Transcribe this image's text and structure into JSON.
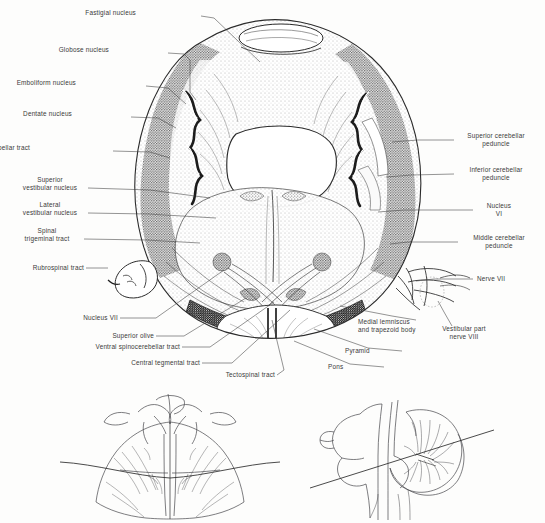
{
  "figure": {
    "kind": "anatomical-illustration",
    "background_color": "#fdfdfc",
    "ink_color": "#2b2b2b",
    "label_color": "#3a3a3a"
  },
  "labels_left": [
    {
      "id": "fastigial-nucleus",
      "text": "Fastigial nucleus",
      "x": 136,
      "y": 13,
      "lead_to_x": 258,
      "lead_to_y": 60
    },
    {
      "id": "globose-nucleus",
      "text": "Globose nucleus",
      "x": 109,
      "y": 50,
      "lead_to_x": 205,
      "lead_to_y": 92
    },
    {
      "id": "emboliform-nucleus",
      "text": "Emboliform nucleus",
      "x": 76,
      "y": 83,
      "lead_to_x": 196,
      "lead_to_y": 106
    },
    {
      "id": "dentate-nucleus",
      "text": "Dentate nucleus",
      "x": 72,
      "y": 114,
      "lead_to_x": 180,
      "lead_to_y": 126
    },
    {
      "id": "nucleocerebellar-tract",
      "text": "Nucleocerebellar tract",
      "x": 30,
      "y": 148,
      "lead_to_x": 168,
      "lead_to_y": 155
    },
    {
      "id": "superior-vestibular-nucleus",
      "text": "Superior\nvestibular nucleus",
      "x": 27,
      "y": 180,
      "lead_to_x": 210,
      "lead_to_y": 196
    },
    {
      "id": "lateral-vestibular-nucleus",
      "text": "Lateral\nvestibular nucleus",
      "x": 13,
      "y": 205,
      "lead_to_x": 215,
      "lead_to_y": 217
    },
    {
      "id": "spinal-trigeminal-tract",
      "text": "Spinal\ntrigeminal tract",
      "x": 30,
      "y": 231,
      "lead_to_x": 200,
      "lead_to_y": 242
    },
    {
      "id": "rubrospinal-tract",
      "text": "Rubrospinal tract",
      "x": 18,
      "y": 266,
      "lead_to_x": 105,
      "lead_to_y": 268
    },
    {
      "id": "nucleus-vii",
      "text": "Nucleus VII",
      "x": 72,
      "y": 316,
      "lead_to_x": 225,
      "lead_to_y": 268
    },
    {
      "id": "superior-olive",
      "text": "Superior olive",
      "x": 108,
      "y": 334,
      "lead_to_x": 246,
      "lead_to_y": 296
    },
    {
      "id": "ventral-spinocerebellar-tract",
      "text": "Ventral spinocerebellar tract",
      "x": 85,
      "y": 345,
      "lead_to_x": 274,
      "lead_to_y": 300
    },
    {
      "id": "central-tegmental-tract",
      "text": "Central tegmental tract",
      "x": 118,
      "y": 361,
      "lead_to_x": 290,
      "lead_to_y": 308
    },
    {
      "id": "tectospinal-tract",
      "text": "Tectospinal tract",
      "x": 225,
      "y": 375,
      "lead_to_x": 272,
      "lead_to_y": 318
    }
  ],
  "labels_right": [
    {
      "id": "superior-cerebellar-peduncle",
      "text": "Superior cerebellar\npeduncle",
      "x": 458,
      "y": 136,
      "lead_to_x": 392,
      "lead_to_y": 141
    },
    {
      "id": "inferior-cerebellar-peduncle",
      "text": "Inferior cerebellar\npeduncle",
      "x": 458,
      "y": 170,
      "lead_to_x": 385,
      "lead_to_y": 176
    },
    {
      "id": "nucleus-vi",
      "text": "Nucleus\nVI",
      "x": 477,
      "y": 206,
      "lead_to_x": 378,
      "lead_to_y": 211
    },
    {
      "id": "middle-cerebellar-peduncle",
      "text": "Middle cerebellar\npeduncle",
      "x": 462,
      "y": 238,
      "lead_to_x": 390,
      "lead_to_y": 243
    },
    {
      "id": "nerve-vii",
      "text": "Nerve VII",
      "x": 477,
      "y": 276,
      "lead_to_x": 418,
      "lead_to_y": 280
    },
    {
      "id": "vestibular-part-nerve-viii",
      "text": "Vestibular part\nnerve VIII",
      "x": 432,
      "y": 329,
      "lead_to_x": 437,
      "lead_to_y": 300
    },
    {
      "id": "medial-lemniscus-trapezoid-body",
      "text": "Medial lemniscus\nand trapezoid body",
      "x": 358,
      "y": 322,
      "lead_to_x": 338,
      "lead_to_y": 306
    },
    {
      "id": "pyramid",
      "text": "Pyramid",
      "x": 345,
      "y": 350,
      "lead_to_x": 312,
      "lead_to_y": 328
    },
    {
      "id": "pons",
      "text": "Pons",
      "x": 328,
      "y": 366,
      "lead_to_x": 292,
      "lead_to_y": 340
    }
  ],
  "inset_diagrams": [
    {
      "id": "dorsal-brainstem-view",
      "caption": "",
      "x": 75,
      "y": 392,
      "w": 215,
      "h": 128
    },
    {
      "id": "midsagittal-cerebellum-view",
      "caption": "",
      "x": 310,
      "y": 392,
      "w": 200,
      "h": 128
    }
  ]
}
